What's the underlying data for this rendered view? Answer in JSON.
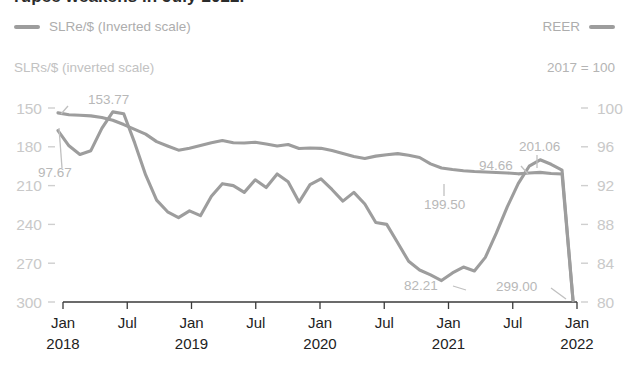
{
  "title": {
    "text": "rupee weakens in July 2022.",
    "clipped": true
  },
  "legend": {
    "left": {
      "label": "SLRe/$ (Inverted scale)",
      "swatch_color": "#9d9d9d"
    },
    "right": {
      "label": "REER",
      "swatch_color": "#9d9d9d"
    }
  },
  "captions": {
    "left": "SLRs/$ (inverted scale)",
    "right": "2017 = 100"
  },
  "chart_data": {
    "type": "line",
    "title": "rupee weakens in July 2022.",
    "xlabel": "",
    "ylabel": "SLRs/$ (inverted scale)",
    "y2label": "2017 = 100",
    "ylim": [
      150,
      300
    ],
    "ylim_inverted": true,
    "y2lim": [
      80,
      100
    ],
    "yticks": [
      "150",
      "180",
      "210",
      "240",
      "270",
      "300"
    ],
    "y2ticks": [
      "100",
      "96",
      "92",
      "88",
      "84",
      "80"
    ],
    "grid": false,
    "legend_position": "top",
    "xticks": [
      {
        "month": "Jan",
        "year": "2018"
      },
      {
        "month": "Jul",
        "year": ""
      },
      {
        "month": "Jan",
        "year": "2019"
      },
      {
        "month": "Jul",
        "year": ""
      },
      {
        "month": "Jan",
        "year": "2020"
      },
      {
        "month": "Jul",
        "year": ""
      },
      {
        "month": "Jan",
        "year": "2021"
      },
      {
        "month": "Jul",
        "year": ""
      },
      {
        "month": "Jan",
        "year": "2022"
      }
    ],
    "x_start": "2018-01",
    "x_end": "2022-07",
    "series": [
      {
        "name": "SLRe/$ (Inverted scale)",
        "axis": "left",
        "color": "#9d9d9d",
        "values": [
          153.77,
          155.2,
          155.6,
          156.1,
          157.3,
          159.5,
          162.8,
          166.5,
          170.2,
          176.0,
          179.4,
          182.6,
          181.1,
          179.0,
          176.8,
          175.2,
          176.9,
          177.1,
          176.5,
          177.8,
          179.4,
          178.2,
          181.3,
          180.9,
          181.2,
          182.9,
          185.1,
          187.5,
          189.0,
          187.2,
          186.1,
          185.3,
          186.6,
          188.3,
          193.2,
          196.4,
          197.6,
          198.5,
          199.1,
          199.5,
          199.9,
          200.2,
          200.9,
          200.3,
          199.8,
          200.6,
          201.06,
          299.0
        ],
        "annotations": [
          {
            "label": "153.77",
            "index": 0
          },
          {
            "label": "199.50",
            "index": 39
          },
          {
            "label": "201.06",
            "index": 46
          },
          {
            "label": "299.00",
            "index": 47
          }
        ]
      },
      {
        "name": "REER",
        "axis": "right",
        "color": "#9d9d9d",
        "values": [
          97.67,
          96.1,
          95.2,
          95.6,
          97.9,
          99.6,
          99.4,
          96.4,
          93.1,
          90.5,
          89.3,
          88.7,
          89.4,
          88.9,
          90.9,
          92.2,
          92.0,
          91.3,
          92.6,
          91.8,
          93.2,
          92.4,
          90.3,
          92.1,
          92.7,
          91.6,
          90.4,
          91.3,
          90.1,
          88.2,
          88.0,
          86.1,
          84.2,
          83.3,
          82.8,
          82.21,
          83.0,
          83.6,
          83.2,
          84.6,
          87.1,
          89.8,
          92.2,
          94.0,
          94.66,
          94.2,
          93.6,
          80.2
        ],
        "annotations": [
          {
            "label": "97.67",
            "index": 0
          },
          {
            "label": "82.21",
            "index": 35
          },
          {
            "label": "94.66",
            "index": 44
          }
        ]
      }
    ]
  }
}
